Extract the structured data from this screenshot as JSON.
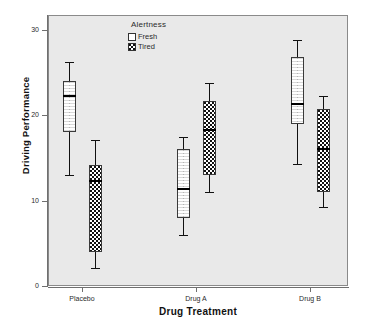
{
  "chart_data": {
    "type": "box",
    "title": "",
    "xlabel": "Drug Treatment",
    "ylabel": "Driving Performance",
    "ylim": [
      0,
      31
    ],
    "yticks": [
      0,
      10,
      20,
      30
    ],
    "ytick_labels": [
      "0",
      "10",
      "20",
      "30"
    ],
    "categories": [
      "Placebo",
      "Drug A",
      "Drug B"
    ],
    "grid": false,
    "legend": {
      "title": "Alertness",
      "position": "inside-top-center",
      "entries": [
        {
          "label": "Fresh",
          "fill": "white"
        },
        {
          "label": "Tired",
          "fill": "checkerboard"
        }
      ]
    },
    "series": [
      {
        "name": "Fresh",
        "boxes": [
          {
            "category": "Placebo",
            "whisker_low": 13.0,
            "q1": 18.0,
            "median": 22.3,
            "q3": 24.0,
            "whisker_high": 26.3
          },
          {
            "category": "Drug A",
            "whisker_low": 6.0,
            "q1": 8.0,
            "median": 11.4,
            "q3": 16.0,
            "whisker_high": 17.5
          },
          {
            "category": "Drug B",
            "whisker_low": 14.3,
            "q1": 19.0,
            "median": 21.3,
            "q3": 26.8,
            "whisker_high": 28.8
          }
        ]
      },
      {
        "name": "Tired",
        "boxes": [
          {
            "category": "Placebo",
            "whisker_low": 2.1,
            "q1": 4.0,
            "median": 12.3,
            "q3": 14.2,
            "whisker_high": 17.1
          },
          {
            "category": "Drug A",
            "whisker_low": 11.0,
            "q1": 13.0,
            "median": 18.3,
            "q3": 21.7,
            "whisker_high": 23.8
          },
          {
            "category": "Drug B",
            "whisker_low": 9.2,
            "q1": 11.0,
            "median": 16.0,
            "q3": 20.8,
            "whisker_high": 22.3
          }
        ]
      }
    ]
  }
}
